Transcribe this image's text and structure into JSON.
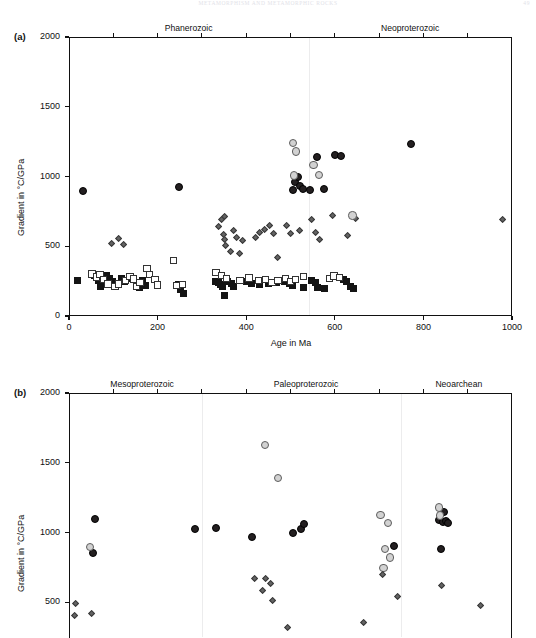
{
  "running_head": {
    "text": "METAMORPHISM AND METAMORPHIC ROCKS",
    "folio": "49"
  },
  "chart_data": [
    {
      "type": "scatter",
      "panel": "a",
      "panel_label": "(a)",
      "title": "",
      "xlabel": "Age in Ma",
      "ylabel": "Gradient in °C/GPa",
      "xlim": [
        0,
        1000
      ],
      "ylim": [
        0,
        2000
      ],
      "xticks": [
        0,
        200,
        400,
        600,
        800,
        1000
      ],
      "yticks": [
        0,
        500,
        1000,
        1500,
        2000
      ],
      "grid": false,
      "legend": "none",
      "era_labels": [
        {
          "label": "Phanerozoic",
          "center_x": 270
        },
        {
          "label": "Neoproterozoic",
          "center_x": 770
        }
      ],
      "era_dividers": [
        541
      ],
      "series": [
        {
          "name": "black-filled-square",
          "marker": "square-filled",
          "color": "#141414",
          "points": [
            [
              20,
              255
            ],
            [
              58,
              290
            ],
            [
              66,
              258
            ],
            [
              72,
              210
            ],
            [
              85,
              290
            ],
            [
              92,
              272
            ],
            [
              98,
              250
            ],
            [
              118,
              270
            ],
            [
              126,
              250
            ],
            [
              140,
              268
            ],
            [
              152,
              225
            ],
            [
              158,
              205
            ],
            [
              165,
              255
            ],
            [
              172,
              218
            ],
            [
              248,
              225
            ],
            [
              252,
              190
            ],
            [
              258,
              160
            ],
            [
              330,
              245
            ],
            [
              338,
              238
            ],
            [
              342,
              228
            ],
            [
              346,
              212
            ],
            [
              350,
              150
            ],
            [
              358,
              250
            ],
            [
              366,
              230
            ],
            [
              372,
              215
            ],
            [
              400,
              245
            ],
            [
              412,
              232
            ],
            [
              430,
              228
            ],
            [
              450,
              232
            ],
            [
              468,
              242
            ],
            [
              486,
              250
            ],
            [
              498,
              230
            ],
            [
              505,
              222
            ],
            [
              530,
              205
            ],
            [
              548,
              258
            ],
            [
              556,
              240
            ],
            [
              560,
              205
            ],
            [
              576,
              200
            ],
            [
              620,
              265
            ],
            [
              626,
              245
            ],
            [
              636,
              212
            ],
            [
              642,
              198
            ]
          ]
        },
        {
          "name": "open-square",
          "marker": "square-open",
          "color": "#ffffff",
          "points": [
            [
              52,
              300
            ],
            [
              62,
              280
            ],
            [
              70,
              295
            ],
            [
              78,
              262
            ],
            [
              88,
              230
            ],
            [
              104,
              212
            ],
            [
              112,
              230
            ],
            [
              128,
              255
            ],
            [
              138,
              285
            ],
            [
              146,
              265
            ],
            [
              152,
              212
            ],
            [
              160,
              238
            ],
            [
              176,
              340
            ],
            [
              182,
              298
            ],
            [
              194,
              262
            ],
            [
              200,
              222
            ],
            [
              236,
              400
            ],
            [
              244,
              218
            ],
            [
              256,
              228
            ],
            [
              332,
              312
            ],
            [
              344,
              288
            ],
            [
              356,
              268
            ],
            [
              386,
              255
            ],
            [
              406,
              272
            ],
            [
              428,
              252
            ],
            [
              444,
              264
            ],
            [
              458,
              242
            ],
            [
              472,
              256
            ],
            [
              488,
              268
            ],
            [
              500,
              248
            ],
            [
              512,
              262
            ],
            [
              530,
              282
            ],
            [
              588,
              268
            ],
            [
              598,
              286
            ],
            [
              610,
              276
            ]
          ]
        },
        {
          "name": "gray-diamond",
          "marker": "diamond",
          "color": "#636363",
          "points": [
            [
              96,
              520
            ],
            [
              112,
              558
            ],
            [
              122,
              512
            ],
            [
              338,
              640
            ],
            [
              344,
              690
            ],
            [
              352,
              715
            ],
            [
              348,
              582
            ],
            [
              352,
              545
            ],
            [
              354,
              505
            ],
            [
              364,
              460
            ],
            [
              372,
              610
            ],
            [
              378,
              565
            ],
            [
              386,
              448
            ],
            [
              392,
              540
            ],
            [
              420,
              565
            ],
            [
              430,
              600
            ],
            [
              442,
              620
            ],
            [
              452,
              645
            ],
            [
              462,
              590
            ],
            [
              470,
              420
            ],
            [
              490,
              648
            ],
            [
              500,
              590
            ],
            [
              520,
              612
            ],
            [
              548,
              690
            ],
            [
              556,
              600
            ],
            [
              566,
              548
            ],
            [
              596,
              722
            ],
            [
              628,
              580
            ],
            [
              646,
              700
            ],
            [
              978,
              688
            ]
          ]
        },
        {
          "name": "black-filled-circle",
          "marker": "circle-dark",
          "color": "#231f20",
          "points": [
            [
              32,
              895
            ],
            [
              248,
              925
            ],
            [
              505,
              905
            ],
            [
              510,
              960
            ],
            [
              516,
              1000
            ],
            [
              522,
              935
            ],
            [
              528,
              912
            ],
            [
              544,
              905
            ],
            [
              560,
              1140
            ],
            [
              576,
              912
            ],
            [
              600,
              1152
            ],
            [
              614,
              1148
            ],
            [
              772,
              1232
            ]
          ]
        },
        {
          "name": "light-gray-circle",
          "marker": "circle-light",
          "color": "#d2d2d2",
          "points": [
            [
              506,
              1242
            ],
            [
              512,
              1180
            ],
            [
              508,
              1008
            ],
            [
              552,
              1080
            ],
            [
              565,
              1012
            ],
            [
              640,
              720
            ]
          ]
        }
      ]
    },
    {
      "type": "scatter",
      "panel": "b",
      "panel_label": "(b)",
      "title": "",
      "xlabel": "",
      "ylabel": "Gradient in °C/GPa",
      "xlim": [
        1000,
        3000
      ],
      "ylim": [
        0,
        2000
      ],
      "xticks": [],
      "yticks": [
        500,
        1000,
        1500,
        2000
      ],
      "grid": false,
      "legend": "none",
      "era_labels": [
        {
          "label": "Mesoproterozoic",
          "center_x": 1330
        },
        {
          "label": "Paleoproterozoic",
          "center_x": 2070
        },
        {
          "label": "Neoarchean",
          "center_x": 2760
        }
      ],
      "era_dividers": [
        1600,
        2500
      ],
      "series": [
        {
          "name": "black-filled-circle",
          "marker": "circle-dark",
          "points": [
            [
              1118,
              1098
            ],
            [
              1108,
              855
            ],
            [
              1570,
              1025
            ],
            [
              1662,
              1032
            ],
            [
              1828,
              965
            ],
            [
              2012,
              998
            ],
            [
              2048,
              1028
            ],
            [
              2062,
              1058
            ],
            [
              2468,
              905
            ],
            [
              2672,
              1088
            ],
            [
              2690,
              1075
            ],
            [
              2700,
              1082
            ],
            [
              2712,
              1068
            ],
            [
              2692,
              1148
            ],
            [
              2680,
              880
            ]
          ]
        },
        {
          "name": "light-gray-circle",
          "marker": "circle-light",
          "points": [
            [
              1096,
              895
            ],
            [
              1884,
              1625
            ],
            [
              1944,
              1392
            ],
            [
              2406,
              1125
            ],
            [
              2440,
              1068
            ],
            [
              2672,
              1180
            ],
            [
              2676,
              1122
            ],
            [
              2428,
              880
            ],
            [
              2448,
              820
            ],
            [
              2420,
              745
            ]
          ]
        },
        {
          "name": "gray-diamond",
          "marker": "diamond",
          "points": [
            [
              1028,
              492
            ],
            [
              1026,
              408
            ],
            [
              1102,
              418
            ],
            [
              1838,
              668
            ],
            [
              1886,
              672
            ],
            [
              1908,
              632
            ],
            [
              1872,
              582
            ],
            [
              1918,
              512
            ],
            [
              1988,
              318
            ],
            [
              2414,
              700
            ],
            [
              2482,
              540
            ],
            [
              2332,
              355
            ],
            [
              2680,
              618
            ],
            [
              2856,
              478
            ]
          ]
        }
      ]
    }
  ]
}
